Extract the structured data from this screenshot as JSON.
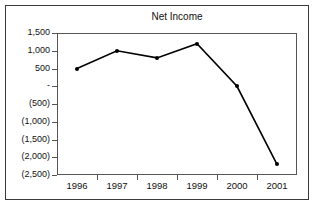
{
  "chart_data": {
    "type": "line",
    "title": "Net Income",
    "xlabel": "",
    "ylabel": "",
    "categories": [
      "1996",
      "1997",
      "1998",
      "1999",
      "2000",
      "2001"
    ],
    "values": [
      500,
      1000,
      800,
      1200,
      0,
      -2200
    ],
    "series": [
      {
        "name": "Net Income",
        "values": [
          500,
          1000,
          800,
          1200,
          0,
          -2200
        ]
      }
    ],
    "ylim": [
      -2500,
      1500
    ],
    "ytick_values": [
      1500,
      1000,
      500,
      0,
      -500,
      -1000,
      -1500,
      -2000,
      -2500
    ],
    "ytick_labels": [
      "1,500",
      "1,000",
      "500",
      "-",
      "(500)",
      "(1,000)",
      "(1,500)",
      "(2,000)",
      "(2,500)"
    ],
    "grid": false,
    "legend": "none",
    "marker": "filled-diamond",
    "line_color": "#000000",
    "marker_color": "#000000",
    "axis_color": "#555555",
    "border_color": "#3a3a3a",
    "background": "#ffffff"
  }
}
